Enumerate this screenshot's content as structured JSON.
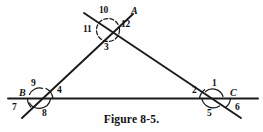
{
  "figure": {
    "caption": "Figure 8-5.",
    "stroke_color": "#1a1a1a",
    "background_color": "#fefefe",
    "vertex_labels": [
      {
        "name": "vertex-label-a",
        "text": "A",
        "x": 131,
        "y": 6
      },
      {
        "name": "vertex-label-b",
        "text": "B",
        "x": 19,
        "y": 88
      },
      {
        "name": "vertex-label-c",
        "text": "C",
        "x": 230,
        "y": 88
      }
    ],
    "angle_labels": [
      {
        "name": "angle-label-10",
        "text": "10",
        "x": 99,
        "y": 6
      },
      {
        "name": "angle-label-12",
        "text": "12",
        "x": 121,
        "y": 20
      },
      {
        "name": "angle-label-11",
        "text": "11",
        "x": 83,
        "y": 25
      },
      {
        "name": "angle-label-3",
        "text": "3",
        "x": 104,
        "y": 43
      },
      {
        "name": "angle-label-9",
        "text": "9",
        "x": 31,
        "y": 80
      },
      {
        "name": "angle-label-4",
        "text": "4",
        "x": 57,
        "y": 87
      },
      {
        "name": "angle-label-7",
        "text": "7",
        "x": 13,
        "y": 104
      },
      {
        "name": "angle-label-8",
        "text": "8",
        "x": 43,
        "y": 110
      },
      {
        "name": "angle-label-1",
        "text": "1",
        "x": 211,
        "y": 80
      },
      {
        "name": "angle-label-2",
        "text": "2",
        "x": 192,
        "y": 87
      },
      {
        "name": "angle-label-5",
        "text": "5",
        "x": 207,
        "y": 110
      },
      {
        "name": "angle-label-6",
        "text": "6",
        "x": 235,
        "y": 104
      }
    ]
  }
}
